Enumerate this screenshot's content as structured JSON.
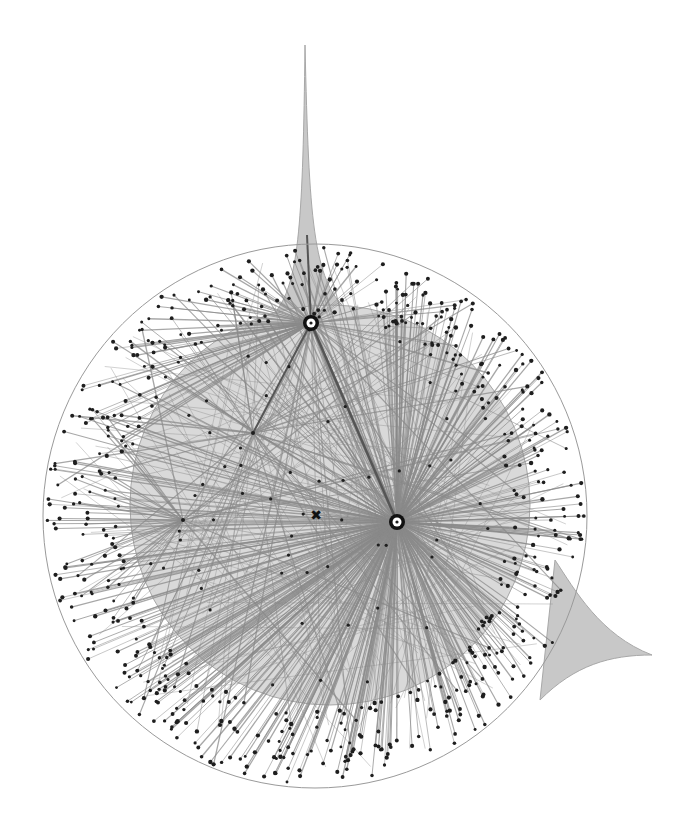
{
  "diagram": {
    "type": "radial-network-graph",
    "colors": {
      "background": "#ffffff",
      "outer_ring": "#9a9a9a",
      "inner_disk_fill": "#d9d9d9",
      "inner_disk_stroke": "#a8a8a8",
      "halo_fill": "#c8c8c8",
      "edge": "#8a8a8a",
      "strong_edge": "#555555",
      "node": "#1e1e1e",
      "hub_ring": "#111111",
      "hub_center": "#ffffff"
    },
    "outer_circle": {
      "cx": 315,
      "cy": 516,
      "r": 272
    },
    "inner_disk": {
      "cx": 330,
      "cy": 505,
      "r": 200
    },
    "spike_top": {
      "x": 307,
      "tip_y": 45,
      "base_y": 300
    },
    "spike_right": {
      "tip_x": 652,
      "tip_y": 655
    },
    "hubs": [
      {
        "id": "hub-a",
        "x": 311,
        "y": 323
      },
      {
        "id": "hub-b",
        "x": 397,
        "y": 522
      }
    ],
    "secondary_junctions": [
      {
        "x": 253,
        "y": 433
      },
      {
        "x": 183,
        "y": 520
      }
    ],
    "centroid_marker": {
      "x": 316,
      "y": 515,
      "glyph": "✖"
    },
    "generation": {
      "seed": 7,
      "peripheral_node_count": 620,
      "interior_node_count": 60,
      "chord_count": 90
    }
  }
}
